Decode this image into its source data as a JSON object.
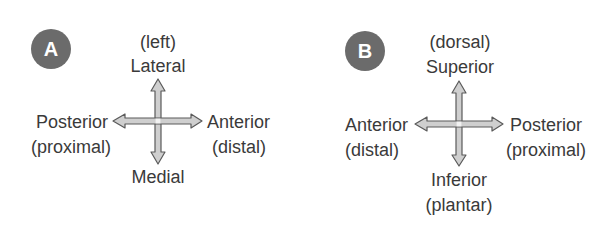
{
  "panels": [
    {
      "badge": "A",
      "top": {
        "paren": "(left)",
        "label": "Lateral"
      },
      "left": {
        "label": "Posterior",
        "paren": "(proximal)"
      },
      "right": {
        "label": "Anterior",
        "paren": "(distal)"
      },
      "bottom": {
        "label": "Medial",
        "paren": ""
      }
    },
    {
      "badge": "B",
      "top": {
        "paren": "(dorsal)",
        "label": "Superior"
      },
      "left": {
        "label": "Anterior",
        "paren": "(distal)"
      },
      "right": {
        "label": "Posterior",
        "paren": "(proximal)"
      },
      "bottom": {
        "label": "Inferior",
        "paren": "(plantar)"
      }
    }
  ],
  "colors": {
    "badge": "#6b6b6b",
    "arrow_fill": "#c9c9c9",
    "arrow_stroke": "#5a5a5a",
    "text": "#3a3a3a"
  }
}
